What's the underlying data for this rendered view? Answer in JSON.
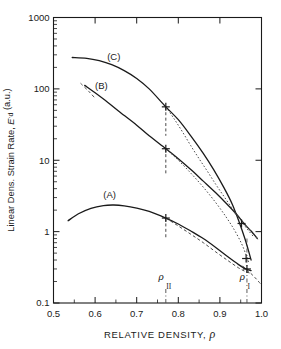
{
  "chart_data": {
    "type": "line",
    "title": "",
    "xlabel": "RELATIVE DENSITY,  ρ",
    "ylabel": "Linear Dens. Strain Rate, Ė_d (a.u.)",
    "xscale": "linear",
    "yscale": "log",
    "xlim": [
      0.5,
      1.0
    ],
    "ylim": [
      0.1,
      1000
    ],
    "grid": false,
    "legend_position": "inline-curve-labels",
    "xticks": [
      0.5,
      0.6,
      0.7,
      0.8,
      0.9,
      1.0
    ],
    "xtick_labels": [
      "0.5",
      "0.6",
      "0.7",
      "0.8",
      "0.9",
      "1.0"
    ],
    "yticks": [
      0.1,
      1,
      10,
      100,
      1000
    ],
    "ytick_labels": [
      "0.1",
      "1",
      "10",
      "100",
      "1000"
    ],
    "annotations": [
      {
        "name": "rho-II",
        "symbol": "ρ",
        "subscript": "II",
        "x": 0.77,
        "type": "vertical-dash-dot-line"
      },
      {
        "name": "rho-I",
        "symbol": "ρ",
        "subscript": "I",
        "x": 0.965,
        "type": "vertical-dash-dot-line"
      }
    ],
    "series": [
      {
        "name": "(A)",
        "label": "(A)",
        "style": "solid",
        "label_x": 0.635,
        "label_y": 3.3,
        "marker_x": 0.77,
        "marker_y": 1.55,
        "points": [
          [
            0.535,
            1.42
          ],
          [
            0.56,
            1.78
          ],
          [
            0.59,
            2.12
          ],
          [
            0.62,
            2.32
          ],
          [
            0.645,
            2.36
          ],
          [
            0.67,
            2.3
          ],
          [
            0.7,
            2.14
          ],
          [
            0.73,
            1.92
          ],
          [
            0.77,
            1.55
          ],
          [
            0.8,
            1.28
          ],
          [
            0.83,
            1.02
          ],
          [
            0.86,
            0.8
          ],
          [
            0.89,
            0.6
          ],
          [
            0.92,
            0.44
          ],
          [
            0.945,
            0.345
          ],
          [
            0.962,
            0.3
          ],
          [
            0.975,
            0.285
          ]
        ]
      },
      {
        "name": "(A)-branch",
        "label": "",
        "style": "dashed",
        "points": [
          [
            0.77,
            1.55
          ],
          [
            0.8,
            1.2
          ],
          [
            0.83,
            0.92
          ],
          [
            0.86,
            0.7
          ],
          [
            0.89,
            0.52
          ],
          [
            0.92,
            0.39
          ],
          [
            0.945,
            0.31
          ],
          [
            0.962,
            0.275
          ],
          [
            0.975,
            0.26
          ]
        ]
      },
      {
        "name": "(B)",
        "label": "(B)",
        "style": "solid",
        "label_x": 0.615,
        "label_y": 108,
        "marker_x": 0.77,
        "marker_y": 14.5,
        "points": [
          [
            0.575,
            112
          ],
          [
            0.6,
            88
          ],
          [
            0.63,
            65
          ],
          [
            0.66,
            47
          ],
          [
            0.7,
            31
          ],
          [
            0.73,
            22
          ],
          [
            0.77,
            14.5
          ],
          [
            0.8,
            10.5
          ],
          [
            0.83,
            7.4
          ],
          [
            0.86,
            5.1
          ],
          [
            0.89,
            3.5
          ],
          [
            0.915,
            2.5
          ],
          [
            0.94,
            1.75
          ],
          [
            0.96,
            1.26
          ],
          [
            0.975,
            1.02
          ],
          [
            0.99,
            0.8
          ]
        ]
      },
      {
        "name": "(B)-branch",
        "label": "",
        "style": "dotted",
        "points": [
          [
            0.77,
            14.5
          ],
          [
            0.8,
            10.0
          ],
          [
            0.83,
            6.6
          ],
          [
            0.86,
            4.2
          ],
          [
            0.89,
            2.55
          ],
          [
            0.915,
            1.6
          ],
          [
            0.935,
            1.05
          ],
          [
            0.952,
            0.68
          ],
          [
            0.963,
            0.47
          ],
          [
            0.97,
            0.36
          ]
        ]
      },
      {
        "name": "(C)",
        "label": "(C)",
        "style": "solid",
        "label_x": 0.645,
        "label_y": 280,
        "marker_x": 0.77,
        "marker_y": 56,
        "points": [
          [
            0.545,
            275
          ],
          [
            0.58,
            268
          ],
          [
            0.61,
            248
          ],
          [
            0.64,
            218
          ],
          [
            0.67,
            180
          ],
          [
            0.7,
            140
          ],
          [
            0.73,
            100
          ],
          [
            0.77,
            56
          ],
          [
            0.8,
            37
          ],
          [
            0.83,
            22
          ],
          [
            0.86,
            12.5
          ],
          [
            0.885,
            7.4
          ],
          [
            0.91,
            4.1
          ],
          [
            0.93,
            2.4
          ],
          [
            0.948,
            1.28
          ],
          [
            0.96,
            0.8
          ],
          [
            0.968,
            0.56
          ],
          [
            0.975,
            0.4
          ]
        ]
      },
      {
        "name": "(C)-branch",
        "label": "",
        "style": "dotted",
        "points": [
          [
            0.77,
            56
          ],
          [
            0.79,
            38
          ],
          [
            0.81,
            25
          ],
          [
            0.83,
            16
          ],
          [
            0.85,
            10.5
          ],
          [
            0.87,
            7.0
          ],
          [
            0.89,
            4.6
          ],
          [
            0.91,
            3.1
          ],
          [
            0.93,
            2.1
          ],
          [
            0.95,
            1.45
          ],
          [
            0.965,
            1.1
          ],
          [
            0.98,
            0.86
          ]
        ]
      },
      {
        "name": "(C)-upper-dash",
        "label": "",
        "style": "dashed",
        "points": [
          [
            0.565,
            120
          ],
          [
            0.585,
            92
          ],
          [
            0.6,
            74
          ]
        ]
      },
      {
        "name": "(B)-right-dash",
        "label": "",
        "style": "dashed",
        "points": [
          [
            0.935,
            1.85
          ],
          [
            0.955,
            1.35
          ],
          [
            0.975,
            1.0
          ],
          [
            0.995,
            0.74
          ]
        ]
      },
      {
        "name": "(A)-right-dash",
        "label": "",
        "style": "dashed",
        "points": [
          [
            0.955,
            0.33
          ],
          [
            0.97,
            0.275
          ],
          [
            0.985,
            0.225
          ],
          [
            0.998,
            0.185
          ]
        ]
      }
    ],
    "markers": [
      {
        "x": 0.77,
        "y": 56,
        "series": "(C)"
      },
      {
        "x": 0.77,
        "y": 14.5,
        "series": "(B)"
      },
      {
        "x": 0.77,
        "y": 1.55,
        "series": "(A)"
      },
      {
        "x": 0.952,
        "y": 1.3,
        "series": "(B)"
      },
      {
        "x": 0.963,
        "y": 0.42,
        "series": "(C)"
      },
      {
        "x": 0.965,
        "y": 0.3,
        "series": "(A)"
      }
    ],
    "marker_drop_lines": [
      {
        "x": 0.77,
        "y_from": 56,
        "y_to": 22
      },
      {
        "x": 0.77,
        "y_from": 14.5,
        "y_to": 6.2
      },
      {
        "x": 0.77,
        "y_from": 1.55,
        "y_to": 0.78
      }
    ]
  }
}
